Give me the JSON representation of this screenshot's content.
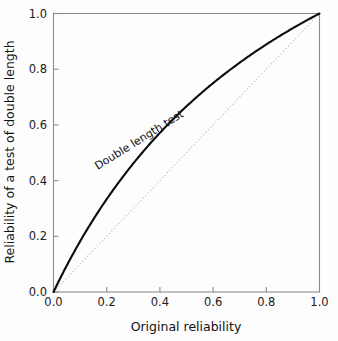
{
  "chart_data": {
    "type": "line",
    "title": "",
    "xlabel": "Original reliability",
    "ylabel": "Reliability of a test of double length",
    "xlim": [
      0.0,
      1.0
    ],
    "ylim": [
      0.0,
      1.0
    ],
    "grid": false,
    "legend_position": "none",
    "xticks": [
      "0.0",
      "0.2",
      "0.4",
      "0.6",
      "0.8",
      "1.0"
    ],
    "xtick_values": [
      0.0,
      0.2,
      0.4,
      0.6,
      0.8,
      1.0
    ],
    "yticks": [
      "0.0",
      "0.2",
      "0.4",
      "0.6",
      "0.8",
      "1.0"
    ],
    "ytick_values": [
      0.0,
      0.2,
      0.4,
      0.6,
      0.8,
      1.0
    ],
    "annotations": [
      {
        "text": "Double length test",
        "x": 0.33,
        "y": 0.47,
        "rotation": -32
      }
    ],
    "series": [
      {
        "name": "Double length test",
        "style": "solid",
        "color": "#0b0b0b",
        "formula": "y = 2x / (1 + x)",
        "x": [
          0.0,
          0.05,
          0.1,
          0.15,
          0.2,
          0.25,
          0.3,
          0.35,
          0.4,
          0.45,
          0.5,
          0.55,
          0.6,
          0.65,
          0.7,
          0.75,
          0.8,
          0.85,
          0.9,
          0.95,
          1.0
        ],
        "values": [
          0.0,
          0.0952,
          0.1818,
          0.2609,
          0.3333,
          0.4,
          0.4615,
          0.5185,
          0.5714,
          0.6207,
          0.6667,
          0.7097,
          0.75,
          0.7879,
          0.8235,
          0.8571,
          0.8889,
          0.9189,
          0.9474,
          0.9744,
          1.0
        ]
      },
      {
        "name": "Identity line",
        "style": "dotted",
        "color": "#b9b9b9",
        "formula": "y = x",
        "x": [
          0.0,
          1.0
        ],
        "values": [
          0.0,
          1.0
        ]
      }
    ]
  },
  "axes": {
    "x_title": "Original reliability",
    "y_title": "Reliability of a test of double length"
  },
  "colors": {
    "curve": "#0b0b0b",
    "identity": "#b9b9b9",
    "frame": "#8c8c8c",
    "text": "#111111",
    "background": "#fdfdfd"
  }
}
